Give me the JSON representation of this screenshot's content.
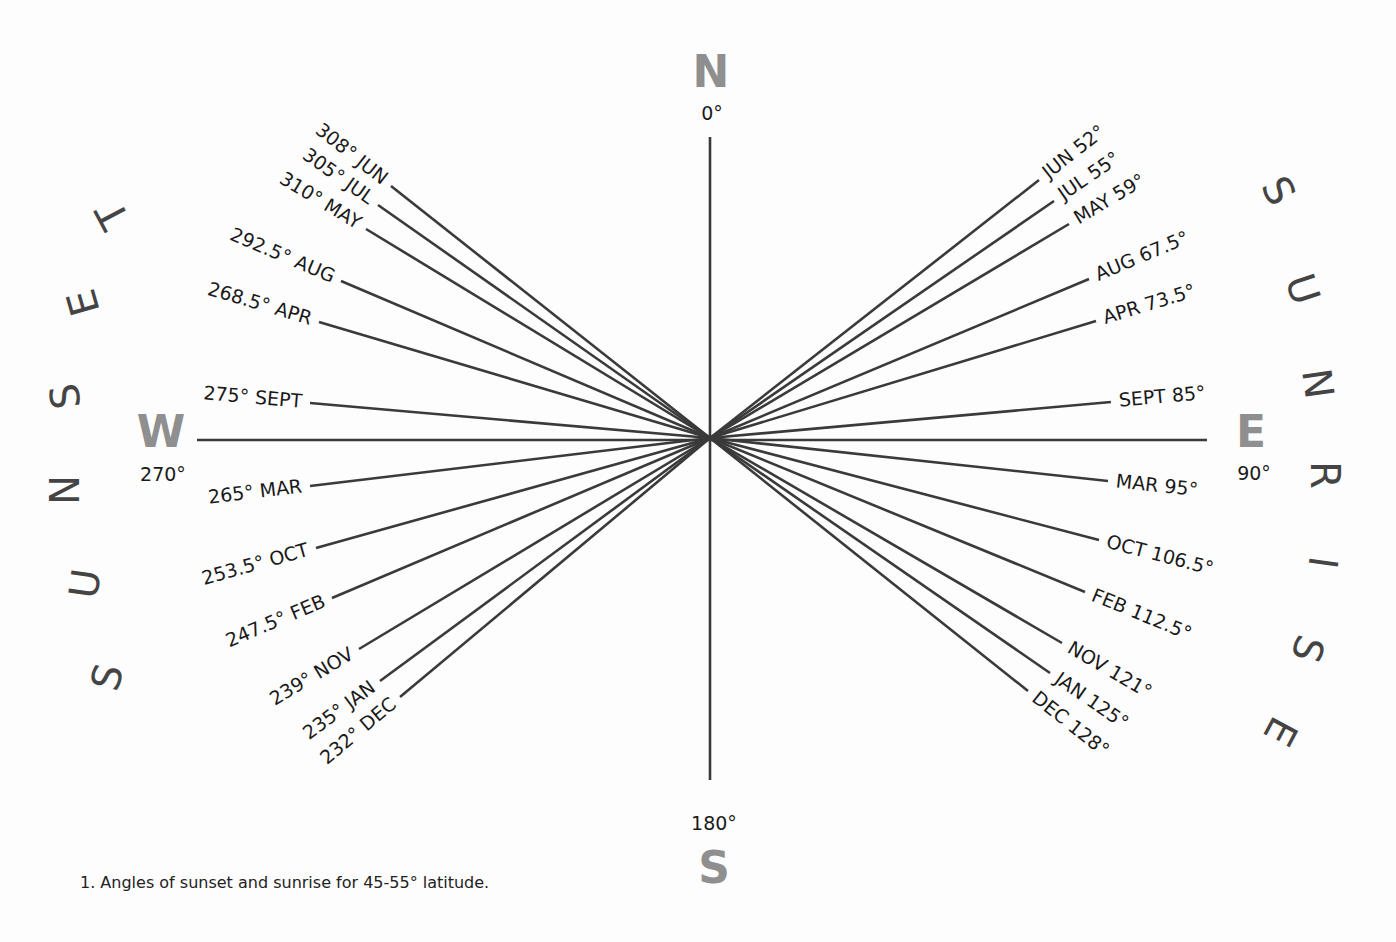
{
  "center": {
    "x": 710,
    "y": 438
  },
  "cardinals": {
    "N": {
      "letter": "N",
      "degree": "0°"
    },
    "E": {
      "letter": "E",
      "degree": "90°"
    },
    "S": {
      "letter": "S",
      "degree": "180°"
    },
    "W": {
      "letter": "W",
      "degree": "270°"
    }
  },
  "arc_words": {
    "sunset": "SUNSET",
    "sunrise": "SUNRISE"
  },
  "caption": "1. Angles of sunset and sunrise for 45-55° latitude.",
  "colors": {
    "cardinal": "#8f8f8f",
    "line": "#3a3a3a",
    "text": "#1a1a1a"
  },
  "chart_data": {
    "type": "diagram",
    "title": "Angles of sunset and sunrise for 45-55° latitude",
    "sunset": [
      {
        "month": "JUN",
        "angle": 308,
        "label": "308° JUN",
        "end": [
          391,
          186
        ]
      },
      {
        "month": "JUL",
        "angle": 305,
        "label": "305° JUL",
        "end": [
          378,
          205
        ]
      },
      {
        "month": "MAY",
        "angle": 310,
        "label": "310° MAY",
        "end": [
          366,
          229
        ]
      },
      {
        "month": "AUG",
        "angle": 292.5,
        "label": "292.5° AUG",
        "end": [
          341,
          281
        ]
      },
      {
        "month": "APR",
        "angle": 268.5,
        "label": "268.5° APR",
        "end": [
          319,
          322
        ]
      },
      {
        "month": "SEPT",
        "angle": 275,
        "label": "275° SEPT",
        "end": [
          310,
          403
        ]
      },
      {
        "month": "MAR",
        "angle": 265,
        "label": "265° MAR",
        "end": [
          310,
          486
        ]
      },
      {
        "month": "OCT",
        "angle": 253.5,
        "label": "253.5° OCT",
        "end": [
          316,
          548
        ]
      },
      {
        "month": "FEB",
        "angle": 247.5,
        "label": "247.5° FEB",
        "end": [
          332,
          598
        ]
      },
      {
        "month": "NOV",
        "angle": 239,
        "label": "239° NOV",
        "end": [
          359,
          649
        ]
      },
      {
        "month": "JAN",
        "angle": 235,
        "label": "235° JAN",
        "end": [
          380,
          681
        ]
      },
      {
        "month": "DEC",
        "angle": 232,
        "label": "232° DEC",
        "end": [
          400,
          697
        ]
      }
    ],
    "sunrise": [
      {
        "month": "JUN",
        "angle": 52,
        "label": "JUN 52°",
        "end": [
          1039,
          180
        ]
      },
      {
        "month": "JUL",
        "angle": 55,
        "label": "JUL 55°",
        "end": [
          1054,
          201
        ]
      },
      {
        "month": "MAY",
        "angle": 59,
        "label": "MAY 59°",
        "end": [
          1069,
          224
        ]
      },
      {
        "month": "AUG",
        "angle": 67.5,
        "label": "AUG 67.5°",
        "end": [
          1089,
          279
        ]
      },
      {
        "month": "APR",
        "angle": 73.5,
        "label": "APR 73.5°",
        "end": [
          1096,
          321
        ]
      },
      {
        "month": "SEPT",
        "angle": 85,
        "label": "SEPT 85°",
        "end": [
          1111,
          402
        ]
      },
      {
        "month": "MAR",
        "angle": 95,
        "label": "MAR 95°",
        "end": [
          1108,
          481
        ]
      },
      {
        "month": "OCT",
        "angle": 106.5,
        "label": "OCT 106.5°",
        "end": [
          1099,
          540
        ]
      },
      {
        "month": "FEB",
        "angle": 112.5,
        "label": "FEB 112.5°",
        "end": [
          1085,
          592
        ]
      },
      {
        "month": "NOV",
        "angle": 121,
        "label": "NOV 121°",
        "end": [
          1062,
          643
        ]
      },
      {
        "month": "JAN",
        "angle": 125,
        "label": "JAN 125°",
        "end": [
          1050,
          673
        ]
      },
      {
        "month": "DEC",
        "angle": 128,
        "label": "DEC 128°",
        "end": [
          1028,
          691
        ]
      }
    ],
    "axes": {
      "N": "0°",
      "E": "90°",
      "S": "180°",
      "W": "270°"
    }
  }
}
